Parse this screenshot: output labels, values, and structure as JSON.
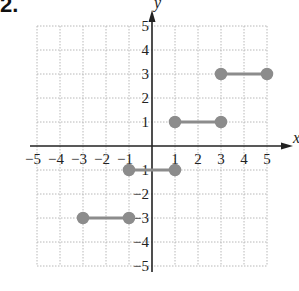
{
  "problem_number": "2.",
  "colors": {
    "grid": "#b8b8b8",
    "axis": "#222222",
    "segment": "#8c8c8c",
    "point": "#8c8c8c"
  },
  "chart_data": {
    "type": "line",
    "title": "",
    "xlabel": "x",
    "ylabel": "y",
    "xlim": [
      -5,
      5
    ],
    "ylim": [
      -5,
      5
    ],
    "grid": true,
    "x_ticks": [
      "-5",
      "-4",
      "-3",
      "-2",
      "-1",
      "1",
      "2",
      "3",
      "4",
      "5"
    ],
    "y_ticks": [
      "5",
      "4",
      "3",
      "2",
      "1",
      "-1",
      "-2",
      "-3",
      "-4",
      "-5"
    ],
    "series": [
      {
        "name": "segment-1",
        "x": [
          -3,
          -1
        ],
        "y": [
          -3,
          -3
        ],
        "endpoints": [
          "closed",
          "closed"
        ]
      },
      {
        "name": "segment-2",
        "x": [
          -1,
          1
        ],
        "y": [
          -1,
          -1
        ],
        "endpoints": [
          "closed",
          "closed"
        ]
      },
      {
        "name": "segment-3",
        "x": [
          1,
          3
        ],
        "y": [
          1,
          1
        ],
        "endpoints": [
          "closed",
          "closed"
        ]
      },
      {
        "name": "segment-4",
        "x": [
          3,
          5
        ],
        "y": [
          3,
          3
        ],
        "endpoints": [
          "closed",
          "closed"
        ]
      }
    ]
  }
}
